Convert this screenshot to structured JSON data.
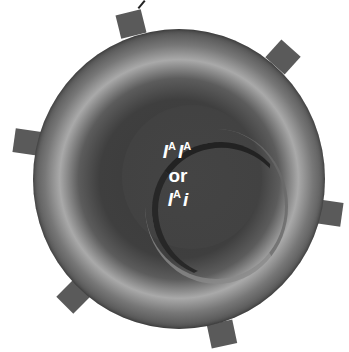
{
  "diagram": {
    "genotype_line1": {
      "allele1": "I",
      "sup1": "A",
      "allele2": "I",
      "sup2": "A"
    },
    "connector": "or",
    "genotype_line2": {
      "allele1": "I",
      "sup1": "A",
      "allele2": "i"
    },
    "antigen_count": 6,
    "colors": {
      "background": "#ffffff",
      "cell_dark": "#2e2e2e",
      "cell_ring_light": "#a9a9a9",
      "antigen": "#5a5a5a",
      "text": "#ffffff"
    }
  }
}
